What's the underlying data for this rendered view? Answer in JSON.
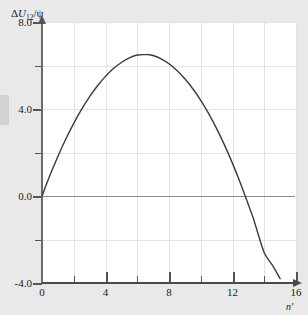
{
  "chart_data": {
    "type": "line",
    "title": "",
    "subtitle": "",
    "ylabel": "ΔU12/ψ",
    "ylabel_parts": {
      "delta": "Δ",
      "symbol": "U",
      "subscript": "12",
      "divider": "/",
      "denominator": "ψ"
    },
    "xlabel": "n'",
    "xlim": [
      0,
      16
    ],
    "ylim": [
      -4.0,
      8.0
    ],
    "grid": true,
    "legend": "none",
    "x_major_ticks": [
      0,
      4,
      8,
      12,
      16
    ],
    "x_minor_ticks": [
      2,
      6,
      10,
      14
    ],
    "x_tick_labels": [
      "0",
      "4",
      "8",
      "12",
      "16"
    ],
    "y_major_ticks": [
      -4.0,
      0.0,
      4.0,
      8.0
    ],
    "y_minor_ticks": [
      -2.0,
      2.0,
      6.0
    ],
    "y_tick_labels": [
      "8.0",
      "4.0",
      "0.0",
      "-4.0"
    ],
    "series": [
      {
        "name": "ΔU12/ψ",
        "color": "#3a3a3a",
        "x": [
          0.0,
          0.5,
          1.0,
          1.5,
          2.0,
          2.5,
          3.0,
          3.5,
          4.0,
          4.5,
          5.0,
          5.5,
          6.0,
          6.5,
          6.7,
          7.0,
          7.5,
          8.0,
          8.5,
          9.0,
          9.5,
          10.0,
          10.5,
          11.0,
          11.5,
          12.0,
          12.5,
          13.0,
          13.3,
          13.5,
          14.0,
          14.5,
          15.0
        ],
        "y": [
          0.0,
          0.95,
          1.82,
          2.62,
          3.34,
          3.99,
          4.57,
          5.07,
          5.5,
          5.86,
          6.14,
          6.35,
          6.48,
          6.5,
          6.5,
          6.46,
          6.31,
          6.08,
          5.77,
          5.39,
          4.93,
          4.4,
          3.79,
          3.1,
          2.34,
          1.5,
          0.59,
          -0.4,
          -1.0,
          -1.47,
          -2.61,
          -3.17,
          -3.8
        ]
      }
    ],
    "annotations": [
      {
        "label": "zero-crossing",
        "x": 13.3,
        "y": 0.0
      },
      {
        "label": "maximum",
        "x": 6.7,
        "y": 6.5
      },
      {
        "label": "origin",
        "x": 0.0,
        "y": 0.0
      }
    ]
  }
}
